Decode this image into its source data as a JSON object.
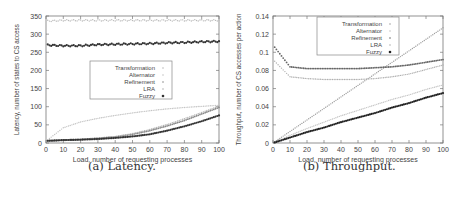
{
  "chart_data": [
    {
      "id": "latency",
      "type": "scatter",
      "caption": "(a) Latency.",
      "title": "",
      "xlabel": "Load, number of requesting processes",
      "ylabel": "Latency, number of states to CS access",
      "xlim": [
        0,
        100
      ],
      "ylim": [
        0,
        350
      ],
      "xticks": [
        0,
        10,
        20,
        30,
        40,
        50,
        60,
        70,
        80,
        90,
        100
      ],
      "yticks": [
        0,
        50,
        100,
        150,
        200,
        250,
        300,
        350
      ],
      "grid": false,
      "legend_position": "center",
      "legend": [
        "Transformation",
        "Alternator",
        "Refinement",
        "LRA",
        "Fuzzy"
      ],
      "x": [
        0,
        10,
        20,
        30,
        40,
        50,
        60,
        70,
        80,
        90,
        100
      ],
      "series": [
        {
          "name": "Transformation",
          "color": "#b8b8b8",
          "values": [
            336,
            338,
            338,
            338,
            338,
            338,
            338,
            338,
            338,
            338,
            338
          ]
        },
        {
          "name": "Alternator",
          "color": "#c4c4c4",
          "values": [
            5,
            42,
            58,
            68,
            76,
            83,
            89,
            94,
            98,
            101,
            104
          ]
        },
        {
          "name": "Refinement",
          "color": "#888888",
          "values": [
            5,
            8,
            10,
            13,
            17,
            24,
            34,
            47,
            62,
            80,
            98
          ]
        },
        {
          "name": "LRA",
          "color": "#b0b0b0",
          "values": [
            5,
            8,
            10,
            14,
            18,
            26,
            37,
            51,
            67,
            84,
            102
          ]
        },
        {
          "name": "Fuzzy",
          "color": "#333333",
          "values": [
            6,
            8,
            9,
            11,
            14,
            18,
            24,
            34,
            46,
            60,
            76
          ]
        },
        {
          "name": "Fuzzy (upper)",
          "color": "#333333",
          "values": [
            270,
            268,
            268,
            271,
            272,
            273,
            274,
            276,
            277,
            279,
            280
          ]
        }
      ]
    },
    {
      "id": "throughput",
      "type": "scatter",
      "caption": "(b) Throughput.",
      "title": "",
      "xlabel": "Load, number of requesting processes",
      "ylabel": "Throughput, number of CS accesses per action",
      "xlim": [
        0,
        100
      ],
      "ylim": [
        0,
        0.14
      ],
      "xticks": [
        0,
        10,
        20,
        30,
        40,
        50,
        60,
        70,
        80,
        90,
        100
      ],
      "yticks": [
        0,
        0.02,
        0.04,
        0.06,
        0.08,
        0.1,
        0.12,
        0.14
      ],
      "ytick_labels": [
        "0",
        "0.02",
        "0.04",
        "0.06",
        "0.08",
        "0.1",
        "0.12",
        "0.14"
      ],
      "grid": false,
      "legend_position": "top-right",
      "legend": [
        "Transformation",
        "Alternator",
        "Refinement",
        "LRA",
        "Fuzzy"
      ],
      "x": [
        0,
        10,
        20,
        30,
        40,
        50,
        60,
        70,
        80,
        90,
        100
      ],
      "series": [
        {
          "name": "Transformation",
          "color": "#a0a0a0",
          "values": [
            0,
            0.0127,
            0.0254,
            0.0381,
            0.0508,
            0.0635,
            0.0762,
            0.0889,
            0.1016,
            0.1143,
            0.127
          ]
        },
        {
          "name": "Alternator",
          "color": "#c4c4c4",
          "values": [
            0,
            0.0085,
            0.016,
            0.023,
            0.03,
            0.036,
            0.042,
            0.048,
            0.053,
            0.059,
            0.064
          ]
        },
        {
          "name": "Refinement",
          "color": "#666666",
          "values": [
            0.108,
            0.084,
            0.082,
            0.082,
            0.082,
            0.082,
            0.083,
            0.084,
            0.086,
            0.089,
            0.092
          ]
        },
        {
          "name": "LRA",
          "color": "#b0b0b0",
          "values": [
            0.092,
            0.073,
            0.071,
            0.07,
            0.07,
            0.07,
            0.071,
            0.073,
            0.076,
            0.081,
            0.086
          ]
        },
        {
          "name": "Fuzzy",
          "color": "#222222",
          "values": [
            0,
            0.006,
            0.012,
            0.017,
            0.023,
            0.028,
            0.033,
            0.039,
            0.044,
            0.05,
            0.055
          ]
        }
      ]
    }
  ]
}
